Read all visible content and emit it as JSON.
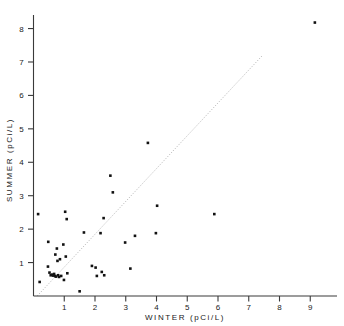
{
  "chart_data": {
    "type": "scatter",
    "title": "",
    "xlabel": "WINTER  (pCi/L)",
    "ylabel": "SUMMER  (pCi/L)",
    "xlim": [
      0,
      9.9
    ],
    "ylim": [
      0,
      8.6
    ],
    "xticks": [
      1,
      2,
      3,
      4,
      5,
      6,
      7,
      8,
      9
    ],
    "yticks": [
      1,
      2,
      3,
      4,
      5,
      6,
      7,
      8
    ],
    "xtick_labels": [
      "1",
      "2",
      "3",
      "4",
      "5",
      "6",
      "7",
      "8",
      "9"
    ],
    "ytick_labels": [
      "1",
      "2",
      "3",
      "4",
      "5",
      "6",
      "7",
      "8"
    ],
    "grid": false,
    "legend": null,
    "marker": "square",
    "marker_color": "#111111",
    "reference_line": {
      "type": "identity",
      "style": "dotted",
      "color": "#b4b4b4",
      "x_start": 0.12,
      "y_start": 0.0,
      "x_end": 7.45,
      "y_end": 7.2
    },
    "points": [
      {
        "x": 0.15,
        "y": 2.45
      },
      {
        "x": 0.2,
        "y": 0.42
      },
      {
        "x": 0.48,
        "y": 1.62
      },
      {
        "x": 0.47,
        "y": 0.88
      },
      {
        "x": 0.52,
        "y": 0.7
      },
      {
        "x": 0.56,
        "y": 0.62
      },
      {
        "x": 0.61,
        "y": 0.64
      },
      {
        "x": 0.64,
        "y": 0.61
      },
      {
        "x": 0.67,
        "y": 0.66
      },
      {
        "x": 0.7,
        "y": 0.6
      },
      {
        "x": 0.71,
        "y": 1.24
      },
      {
        "x": 0.73,
        "y": 0.58
      },
      {
        "x": 0.76,
        "y": 1.42
      },
      {
        "x": 0.78,
        "y": 1.05
      },
      {
        "x": 0.8,
        "y": 0.62
      },
      {
        "x": 0.83,
        "y": 0.57
      },
      {
        "x": 0.86,
        "y": 1.1
      },
      {
        "x": 0.9,
        "y": 0.6
      },
      {
        "x": 0.97,
        "y": 1.54
      },
      {
        "x": 0.99,
        "y": 0.48
      },
      {
        "x": 1.03,
        "y": 2.52
      },
      {
        "x": 1.05,
        "y": 1.18
      },
      {
        "x": 1.08,
        "y": 2.3
      },
      {
        "x": 1.1,
        "y": 0.68
      },
      {
        "x": 1.5,
        "y": 0.14
      },
      {
        "x": 1.64,
        "y": 1.9
      },
      {
        "x": 1.9,
        "y": 0.9
      },
      {
        "x": 2.02,
        "y": 0.85
      },
      {
        "x": 2.06,
        "y": 0.6
      },
      {
        "x": 2.18,
        "y": 1.88
      },
      {
        "x": 2.22,
        "y": 0.72
      },
      {
        "x": 2.28,
        "y": 2.33
      },
      {
        "x": 2.3,
        "y": 0.62
      },
      {
        "x": 2.5,
        "y": 3.6
      },
      {
        "x": 2.58,
        "y": 3.1
      },
      {
        "x": 2.98,
        "y": 1.6
      },
      {
        "x": 3.15,
        "y": 0.82
      },
      {
        "x": 3.3,
        "y": 1.8
      },
      {
        "x": 3.72,
        "y": 4.58
      },
      {
        "x": 3.98,
        "y": 1.88
      },
      {
        "x": 4.02,
        "y": 2.7
      },
      {
        "x": 5.88,
        "y": 2.45
      },
      {
        "x": 9.15,
        "y": 8.18
      }
    ]
  }
}
